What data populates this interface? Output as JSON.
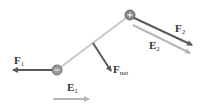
{
  "diagram": {
    "colors": {
      "force": "#5a5a5a",
      "field": "#b8b8b8",
      "rod": "#c8c8c8",
      "charge_fill": "#9a9a9a",
      "charge_stroke": "#555555",
      "text": "#333333"
    },
    "charges": [
      {
        "id": "negative",
        "sign": "−",
        "x": 57,
        "y": 70
      },
      {
        "id": "positive",
        "sign": "+",
        "x": 130,
        "y": 15
      }
    ],
    "labels": {
      "f1": {
        "main": "F",
        "sub": "1"
      },
      "f2": {
        "main": "F",
        "sub": "2"
      },
      "e1": {
        "main": "E",
        "sub": "1"
      },
      "e2": {
        "main": "E",
        "sub": "2"
      },
      "fnet": {
        "main": "F",
        "sub": "net"
      }
    }
  }
}
